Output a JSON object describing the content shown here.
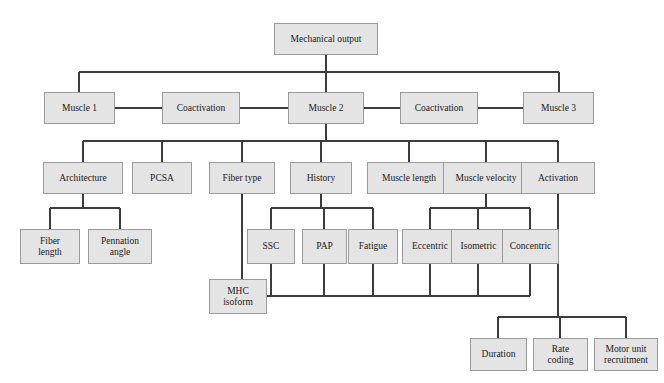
{
  "diagram": {
    "style": {
      "node_fill": "#e4e4e4",
      "node_border": "#9a9a9a",
      "line_color": "#3c3c3c",
      "background": "#ffffff",
      "text_color": "#1a1a1a"
    },
    "nodes": [
      {
        "id": "mechanical-output",
        "label": "Mechanical output",
        "x": 274,
        "y": 23,
        "w": 104,
        "h": 32,
        "level": 0
      },
      {
        "id": "muscle-1",
        "label": "Muscle 1",
        "x": 44,
        "y": 92,
        "w": 71,
        "h": 32,
        "level": 1
      },
      {
        "id": "coactivation-left",
        "label": "Coactivation",
        "x": 162,
        "y": 92,
        "w": 78,
        "h": 32,
        "level": 1
      },
      {
        "id": "muscle-2",
        "label": "Muscle 2",
        "x": 288,
        "y": 92,
        "w": 76,
        "h": 32,
        "level": 1
      },
      {
        "id": "coactivation-right",
        "label": "Coactivation",
        "x": 400,
        "y": 92,
        "w": 78,
        "h": 32,
        "level": 1
      },
      {
        "id": "muscle-3",
        "label": "Muscle 3",
        "x": 523,
        "y": 92,
        "w": 71,
        "h": 32,
        "level": 1
      },
      {
        "id": "architecture",
        "label": "Architecture",
        "x": 43,
        "y": 162,
        "w": 80,
        "h": 32,
        "level": 2
      },
      {
        "id": "pcsa",
        "label": "PCSA",
        "x": 132,
        "y": 162,
        "w": 60,
        "h": 32,
        "level": 2
      },
      {
        "id": "fiber-type",
        "label": "Fiber type",
        "x": 209,
        "y": 162,
        "w": 66,
        "h": 32,
        "level": 2
      },
      {
        "id": "history",
        "label": "History",
        "x": 290,
        "y": 162,
        "w": 62,
        "h": 32,
        "level": 2
      },
      {
        "id": "muscle-length",
        "label": "Muscle length",
        "x": 367,
        "y": 162,
        "w": 84,
        "h": 32,
        "level": 2
      },
      {
        "id": "muscle-velocity",
        "label": "Muscle velocity",
        "x": 443,
        "y": 162,
        "w": 86,
        "h": 32,
        "level": 2
      },
      {
        "id": "activation",
        "label": "Activation",
        "x": 521,
        "y": 162,
        "w": 74,
        "h": 32,
        "level": 2
      },
      {
        "id": "fiber-length",
        "label": "Fiber\nlength",
        "x": 20,
        "y": 229,
        "w": 60,
        "h": 35,
        "level": 3
      },
      {
        "id": "pennation-angle",
        "label": "Pennation\nangle",
        "x": 88,
        "y": 229,
        "w": 64,
        "h": 35,
        "level": 3
      },
      {
        "id": "ssc",
        "label": "SSC",
        "x": 247,
        "y": 229,
        "w": 48,
        "h": 35,
        "level": 3
      },
      {
        "id": "pap",
        "label": "PAP",
        "x": 302,
        "y": 229,
        "w": 45,
        "h": 35,
        "level": 3
      },
      {
        "id": "fatigue",
        "label": "Fatigue",
        "x": 348,
        "y": 229,
        "w": 50,
        "h": 35,
        "level": 3
      },
      {
        "id": "eccentric",
        "label": "Eccentric",
        "x": 402,
        "y": 229,
        "w": 56,
        "h": 35,
        "level": 3
      },
      {
        "id": "isometric",
        "label": "Isometric",
        "x": 451,
        "y": 229,
        "w": 55,
        "h": 35,
        "level": 3
      },
      {
        "id": "concentric",
        "label": "Concentric",
        "x": 502,
        "y": 229,
        "w": 57,
        "h": 35,
        "level": 3
      },
      {
        "id": "mhc-isoform",
        "label": "MHC\nisoform",
        "x": 209,
        "y": 279,
        "w": 58,
        "h": 35,
        "level": 4
      },
      {
        "id": "duration",
        "label": "Duration",
        "x": 470,
        "y": 338,
        "w": 57,
        "h": 33,
        "level": 4
      },
      {
        "id": "rate-coding",
        "label": "Rate\ncoding",
        "x": 533,
        "y": 338,
        "w": 55,
        "h": 33,
        "level": 4
      },
      {
        "id": "motor-unit-recruitment",
        "label": "Motor unit\nrecruitment",
        "x": 594,
        "y": 338,
        "w": 64,
        "h": 33,
        "level": 4
      }
    ],
    "edges": [
      {
        "from": "mechanical-output",
        "to": "muscle-1",
        "type": "tree"
      },
      {
        "from": "mechanical-output",
        "to": "muscle-2",
        "type": "tree"
      },
      {
        "from": "mechanical-output",
        "to": "muscle-3",
        "type": "tree"
      },
      {
        "from": "muscle-1",
        "to": "coactivation-left",
        "type": "link"
      },
      {
        "from": "coactivation-left",
        "to": "muscle-2",
        "type": "link"
      },
      {
        "from": "muscle-2",
        "to": "coactivation-right",
        "type": "link"
      },
      {
        "from": "coactivation-right",
        "to": "muscle-3",
        "type": "link"
      },
      {
        "from": "muscle-2",
        "to": "architecture",
        "type": "tree"
      },
      {
        "from": "muscle-2",
        "to": "pcsa",
        "type": "tree"
      },
      {
        "from": "muscle-2",
        "to": "fiber-type",
        "type": "tree"
      },
      {
        "from": "muscle-2",
        "to": "history",
        "type": "tree"
      },
      {
        "from": "muscle-2",
        "to": "muscle-length",
        "type": "tree"
      },
      {
        "from": "muscle-2",
        "to": "muscle-velocity",
        "type": "tree"
      },
      {
        "from": "muscle-2",
        "to": "activation",
        "type": "tree"
      },
      {
        "from": "architecture",
        "to": "fiber-length",
        "type": "tree"
      },
      {
        "from": "architecture",
        "to": "pennation-angle",
        "type": "tree"
      },
      {
        "from": "history",
        "to": "ssc",
        "type": "tree"
      },
      {
        "from": "history",
        "to": "pap",
        "type": "tree"
      },
      {
        "from": "history",
        "to": "fatigue",
        "type": "tree"
      },
      {
        "from": "muscle-velocity",
        "to": "eccentric",
        "type": "tree"
      },
      {
        "from": "muscle-velocity",
        "to": "isometric",
        "type": "tree"
      },
      {
        "from": "muscle-velocity",
        "to": "concentric",
        "type": "tree"
      },
      {
        "from": "fiber-type",
        "to": "mhc-isoform",
        "type": "tree"
      },
      {
        "from": "mhc-isoform",
        "to": "ssc",
        "type": "bus"
      },
      {
        "from": "mhc-isoform",
        "to": "pap",
        "type": "bus"
      },
      {
        "from": "mhc-isoform",
        "to": "fatigue",
        "type": "bus"
      },
      {
        "from": "mhc-isoform",
        "to": "eccentric",
        "type": "bus"
      },
      {
        "from": "mhc-isoform",
        "to": "isometric",
        "type": "bus"
      },
      {
        "from": "mhc-isoform",
        "to": "concentric",
        "type": "bus"
      },
      {
        "from": "activation",
        "to": "duration",
        "type": "tree"
      },
      {
        "from": "activation",
        "to": "rate-coding",
        "type": "tree"
      },
      {
        "from": "activation",
        "to": "motor-unit-recruitment",
        "type": "tree"
      }
    ]
  }
}
